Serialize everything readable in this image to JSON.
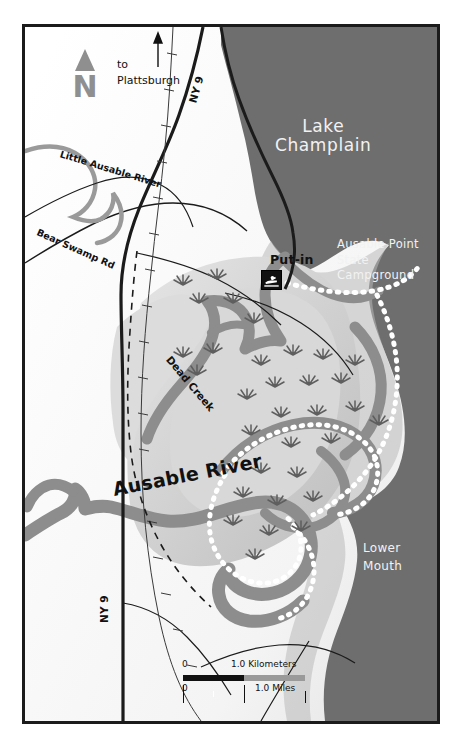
{
  "figure": {
    "kind": "reference-map",
    "title_in_pixels": false,
    "frame_color": "#1b1b1b",
    "background_color": "#ffffff"
  },
  "colors": {
    "lake_water": "#6e6e6e",
    "marsh_land": "#cfcfcf",
    "upland_land": "#ffffff",
    "river_channel": "#8d8d8d",
    "sandbar_dots": "#ffffff",
    "road_line": "#1b1b1b",
    "north_arrow": "#8f8f8f",
    "label_dark": "#111111",
    "label_light": "#f2f2f2"
  },
  "water_features": [
    {
      "name": "Lake Champlain",
      "label": "Lake Champlain",
      "label_lines": [
        "Lake",
        "Champlain"
      ],
      "label_color": "light"
    },
    {
      "name": "Ausable River",
      "label": "Ausable River",
      "label_color": "dark"
    },
    {
      "name": "Little Ausable River",
      "label": "Little Ausable River",
      "label_color": "dark"
    },
    {
      "name": "Dead Creek",
      "label": "Dead Creek",
      "label_color": "dark"
    }
  ],
  "place_labels": {
    "lake": {
      "line1": "Lake",
      "line2": "Champlain"
    },
    "campground": {
      "line1": "Ausable Point",
      "line2": "State",
      "line3": "Campground"
    },
    "lower_mouth": {
      "line1": "Lower",
      "line2": "Mouth"
    },
    "put_in": "Put-in",
    "ausable_river": "Ausable River",
    "dead_creek": "Dead Creek",
    "little_ausable_river": "Little Ausable River",
    "bear_swamp_road": "Bear Swamp Rd",
    "direction_note": {
      "line1": "to",
      "line2": "Plattsburgh"
    },
    "highway_north": "NY 9",
    "highway_south": "NY 9"
  },
  "north_arrow": {
    "letter": "N",
    "icon": "north-arrow-triangle"
  },
  "markers": [
    {
      "name": "put-in",
      "label": "Put-in",
      "icon": "boat-launch-icon"
    }
  ],
  "scale_bar": {
    "kilometers": {
      "zero": "0",
      "value": "1.0 Kilometers"
    },
    "miles": {
      "zero": "0",
      "value": "1.0 Miles"
    }
  }
}
